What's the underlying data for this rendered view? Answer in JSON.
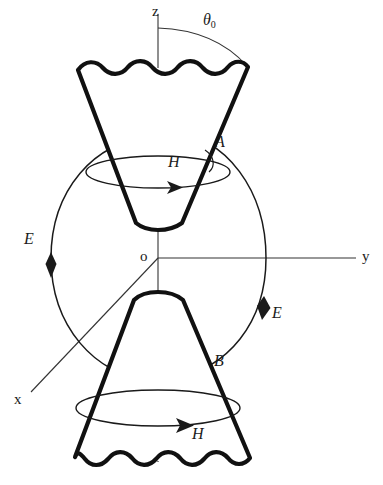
{
  "figure": {
    "stroke_color": "#1a1a1a",
    "cone_stroke_color": "#111111",
    "thin_stroke_color": "#333333",
    "background": "#ffffff"
  },
  "axes": {
    "z": {
      "label": "z",
      "x": 152,
      "y": 5
    },
    "y": {
      "label": "y",
      "x": 362,
      "y": 248
    },
    "x": {
      "label": "x",
      "x": 14,
      "y": 391
    },
    "origin": {
      "label": "o",
      "x": 140,
      "y": 248
    }
  },
  "angle": {
    "symbol": "θ",
    "subscript": "0",
    "label": "θ0",
    "x": 203,
    "y": 11
  },
  "field_labels": {
    "e_left": {
      "label": "E",
      "x": 24,
      "y": 231
    },
    "e_right": {
      "label": "E",
      "x": 272,
      "y": 305
    },
    "h_upper": {
      "label": "H",
      "x": 168,
      "y": 153
    },
    "h_lower": {
      "label": "H",
      "x": 192,
      "y": 425
    }
  },
  "points": {
    "a": {
      "label": "A",
      "x": 215,
      "y": 133
    },
    "b": {
      "label": "B",
      "x": 214,
      "y": 352
    }
  },
  "geometry": {
    "upper_cone": {
      "apex_x": 158,
      "apex_y": 224,
      "top_y": 68,
      "top_left_x": 78,
      "top_right_x": 248,
      "apex_left_x": 136,
      "apex_right_x": 182
    },
    "lower_cone": {
      "apex_x": 158,
      "apex_y": 296,
      "bottom_y": 458,
      "bottom_left_x": 75,
      "bottom_right_x": 250,
      "apex_left_x": 134,
      "apex_right_x": 183
    },
    "h_ellipse_upper": {
      "cx": 158,
      "cy": 172,
      "rx": 72,
      "ry": 16
    },
    "h_ellipse_lower": {
      "cx": 158,
      "cy": 408,
      "rx": 82,
      "ry": 18
    },
    "e_field_arcs": 2
  }
}
